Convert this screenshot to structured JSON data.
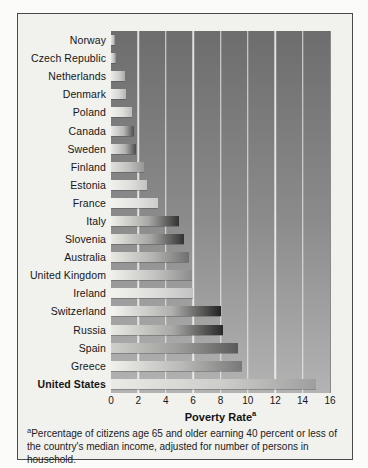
{
  "figure": {
    "xlabel": "Poverty Rate",
    "xlabel_sup": "a",
    "footnote_sup": "a",
    "footnote": "Percentage of citizens age 65 and older earning 40 percent or less of the country's median income, adjusted for number of persons in household."
  },
  "colors": {
    "page_bg": "#fbfbf9",
    "panel_bg": "#f1f1ee",
    "panel_border": "#4a4a4a",
    "plot_bg_top": "#6d6d6d",
    "plot_bg_bottom": "#b3b3b3",
    "gridline": "#f5f4f0",
    "text": "#1b1b1b"
  },
  "chart_data": {
    "type": "bar",
    "orientation": "horizontal",
    "title": "",
    "xlabel": "Poverty Rate",
    "ylabel": "",
    "x_unit": "percent",
    "xlim": [
      0,
      16
    ],
    "xticks": [
      0,
      2,
      4,
      6,
      8,
      10,
      12,
      14,
      16
    ],
    "grid": "vertical",
    "legend": "none",
    "categories": [
      "Norway",
      "Czech Republic",
      "Netherlands",
      "Denmark",
      "Poland",
      "Canada",
      "Sweden",
      "Finland",
      "Estonia",
      "France",
      "Italy",
      "Slovenia",
      "Australia",
      "United Kingdom",
      "Ireland",
      "Switzerland",
      "Russia",
      "Spain",
      "Greece",
      "United States"
    ],
    "values": [
      0.3,
      0.4,
      1.0,
      1.1,
      1.5,
      1.7,
      1.8,
      2.4,
      2.6,
      3.4,
      5.0,
      5.3,
      5.7,
      5.9,
      6.0,
      8.0,
      8.2,
      9.3,
      9.6,
      15.0
    ],
    "emphasized_category": "United States",
    "bar_gradients": [
      [
        "#e2e2e0",
        "#c6c6c4",
        "#8f8f8f"
      ],
      [
        "#e2e2e0",
        "#c2c2c0",
        "#8a8a8a"
      ],
      [
        "#ebebe8",
        "#d0d0ce",
        "#aaaaaa"
      ],
      [
        "#edede9",
        "#d6d6d4",
        "#b4b4b4"
      ],
      [
        "#f2f2ee",
        "#dededc",
        "#bcbcbc"
      ],
      [
        "#e8e8e5",
        "#b8b8b6",
        "#4f4f4f"
      ],
      [
        "#e8e8e5",
        "#b4b4b2",
        "#4c4c4c"
      ],
      [
        "#e0e0dd",
        "#c0c0be",
        "#979797"
      ],
      [
        "#f0f0ec",
        "#dededc",
        "#c2c2c2"
      ],
      [
        "#f2f2ee",
        "#e2e2e0",
        "#cccccc"
      ],
      [
        "#f0f0ea",
        "#a8a8a6",
        "#323232"
      ],
      [
        "#e9e9e4",
        "#a4a4a2",
        "#333333"
      ],
      [
        "#e9e9e4",
        "#b2b2b0",
        "#6f6f6f"
      ],
      [
        "#f0f0ec",
        "#c2c2c0",
        "#8c8c8c"
      ],
      [
        "#f2f2ee",
        "#dcdcda",
        "#c2c2c2"
      ],
      [
        "#f4f4f0",
        "#b0b0ae",
        "#222222"
      ],
      [
        "#e9e9e4",
        "#a8a8a6",
        "#282828"
      ],
      [
        "#cfcfcb",
        "#9a9a98",
        "#5a5a5a"
      ],
      [
        "#f0f0ec",
        "#b8b8b6",
        "#787878"
      ],
      [
        "#eaeae6",
        "#ccccca",
        "#9e9e9e"
      ]
    ],
    "footnote": "Percentage of citizens age 65 and older earning 40 percent or less of the country's median income, adjusted for number of persons in household."
  }
}
